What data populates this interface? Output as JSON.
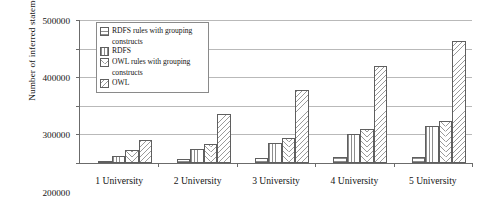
{
  "chart_data": {
    "type": "bar",
    "title": "",
    "xlabel": "",
    "ylabel": "Number of inferred statements",
    "ylim": [
      0,
      500000
    ],
    "ytick_values": [
      0,
      100000,
      200000,
      300000,
      400000,
      500000
    ],
    "ytick_labels": [
      "0",
      "100000",
      "200000",
      "300000",
      "400000",
      "500000"
    ],
    "grid": true,
    "legend_position": "upper-left-inside",
    "categories": [
      "1 University",
      "2 University",
      "3 University",
      "4 University",
      "5 University"
    ],
    "series": [
      {
        "name": "RDFS rules with grouping constructs",
        "pattern": "horizontal-lines",
        "values": [
          8000,
          15000,
          18000,
          20000,
          22000
        ]
      },
      {
        "name": "RDFS",
        "pattern": "vertical-lines",
        "values": [
          25000,
          48000,
          70000,
          100000,
          128000
        ]
      },
      {
        "name": "OWL rules with grouping constructs",
        "pattern": "chevron-hatch",
        "values": [
          45000,
          65000,
          88000,
          118000,
          148000
        ]
      },
      {
        "name": "OWL",
        "pattern": "diagonal-hatch",
        "values": [
          80000,
          170000,
          255000,
          340000,
          425000
        ]
      }
    ]
  },
  "legend": {
    "entries": [
      {
        "line1": "RDFS rules with grouping",
        "line2": "constructs"
      },
      {
        "line1": "RDFS",
        "line2": ""
      },
      {
        "line1": "OWL rules with grouping",
        "line2": "constructs"
      },
      {
        "line1": "OWL",
        "line2": ""
      }
    ]
  },
  "colors": {
    "axis": "#6b6b6b",
    "grid": "#b9b9b9",
    "bar_outline": "#5f5f5f",
    "hatch": "#8d8d8d",
    "text": "#141414",
    "background": "#ffffff"
  }
}
